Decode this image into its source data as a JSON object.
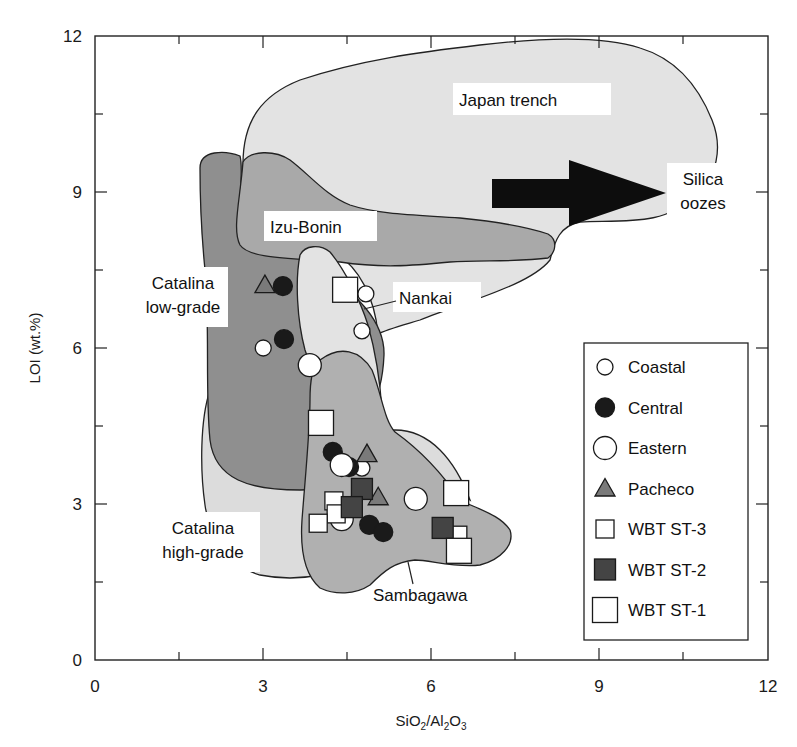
{
  "chart_data": {
    "type": "scatter",
    "title": "",
    "xlabel": "SiO2/Al2O3",
    "xlabel_parts": {
      "a": "SiO",
      "a_sub": "2",
      "b": "/Al",
      "b_sub": "2",
      "c": "O",
      "c_sub": "3"
    },
    "ylabel": "LOI (wt.%)",
    "xlim": [
      0,
      12
    ],
    "ylim": [
      0,
      12
    ],
    "xticks": [
      0,
      3,
      6,
      9,
      12
    ],
    "yticks": [
      0,
      3,
      6,
      9,
      12
    ],
    "minor_xticks": [
      1.5,
      4.5,
      7.5,
      10.5
    ],
    "minor_yticks": [
      1.5,
      4.5,
      7.5,
      10.5
    ],
    "grid": false,
    "legend_position": "lower right",
    "series": [
      {
        "name": "Coastal",
        "marker": "circle-small-open",
        "color": "#ffffff",
        "points": [
          [
            3.0,
            6.0
          ],
          [
            4.83,
            7.04
          ],
          [
            4.76,
            6.33
          ],
          [
            4.76,
            3.69
          ]
        ]
      },
      {
        "name": "Central",
        "marker": "circle-filled",
        "color": "#1a1a1a",
        "points": [
          [
            3.35,
            7.19
          ],
          [
            3.37,
            6.17
          ],
          [
            4.24,
            4.0
          ],
          [
            4.53,
            3.71
          ],
          [
            4.89,
            2.6
          ],
          [
            5.14,
            2.46
          ]
        ]
      },
      {
        "name": "Eastern",
        "marker": "circle-large-open",
        "color": "#ffffff",
        "points": [
          [
            3.83,
            5.67
          ],
          [
            4.4,
            3.75
          ],
          [
            4.4,
            2.71
          ],
          [
            5.72,
            3.1
          ]
        ]
      },
      {
        "name": "Pacheco",
        "marker": "triangle",
        "color": "#7a7a7a",
        "points": [
          [
            3.03,
            7.21
          ],
          [
            4.85,
            3.96
          ],
          [
            5.05,
            3.13
          ]
        ]
      },
      {
        "name": "WBT ST-3",
        "marker": "square-small-open",
        "color": "#ffffff",
        "points": [
          [
            4.26,
            3.06
          ],
          [
            4.3,
            2.81
          ],
          [
            3.98,
            2.63
          ],
          [
            6.47,
            2.4
          ]
        ]
      },
      {
        "name": "WBT ST-2",
        "marker": "square-filled",
        "color": "#444444",
        "points": [
          [
            4.76,
            3.29
          ],
          [
            4.58,
            2.94
          ],
          [
            6.2,
            2.54
          ]
        ]
      },
      {
        "name": "WBT ST-1",
        "marker": "square-large-open",
        "color": "#ffffff",
        "points": [
          [
            4.46,
            7.12
          ],
          [
            4.03,
            4.56
          ],
          [
            6.44,
            3.21
          ],
          [
            6.49,
            2.1
          ]
        ]
      }
    ],
    "regions": [
      {
        "name": "Japan trench",
        "fill": "#e3e3e3"
      },
      {
        "name": "Izu-Bonin",
        "fill": "#a9a9a9"
      },
      {
        "name": "Catalina low-grade",
        "fill": "#8f8f8f"
      },
      {
        "name": "Catalina high-grade",
        "fill": "#dcdcdc"
      },
      {
        "name": "Nankai",
        "fill": "#e3e3e3"
      },
      {
        "name": "Sambagawa",
        "fill": "#b0b0b0"
      }
    ],
    "annotations": [
      {
        "text": "Silica oozes",
        "type": "arrow",
        "direction": "right"
      }
    ]
  },
  "labels": {
    "japan_trench": "Japan trench",
    "izu_bonin": "Izu-Bonin",
    "nankai": "Nankai",
    "catalina_low_1": "Catalina",
    "catalina_low_2": "low-grade",
    "catalina_high_1": "Catalina",
    "catalina_high_2": "high-grade",
    "sambagawa": "Sambagawa",
    "silica_1": "Silica",
    "silica_2": "oozes"
  },
  "axis": {
    "x_ticks": [
      "0",
      "3",
      "6",
      "9",
      "12"
    ],
    "y_ticks": [
      "0",
      "3",
      "6",
      "9",
      "12"
    ]
  },
  "legend": {
    "items": [
      "Coastal",
      "Central",
      "Eastern",
      "Pacheco",
      "WBT ST-3",
      "WBT ST-2",
      "WBT ST-1"
    ]
  }
}
